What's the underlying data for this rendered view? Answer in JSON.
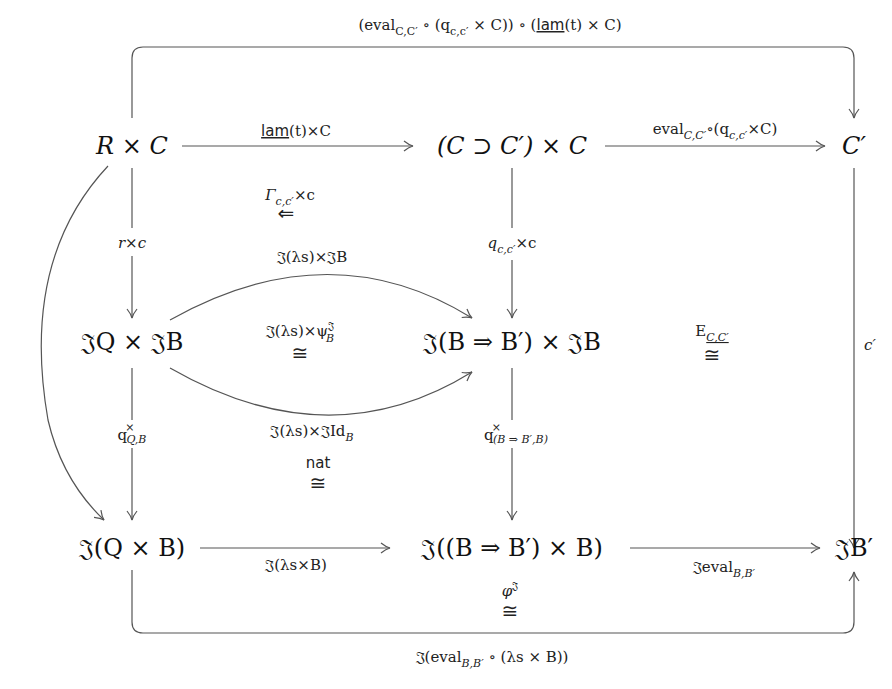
{
  "diagram": {
    "objects": {
      "r_times_c": "R × C",
      "implication_times_c": "(C ⊃ C′) × C",
      "c_prime": "C′",
      "jq_times_jb": "𝔍Q × 𝔍B",
      "j_exp_times_jb": "𝔍(B ⇒ B′) × 𝔍B",
      "j_q_times_b": "𝔍(Q × B)",
      "j_exp_times_b": "𝔍((B ⇒ B′) × B)",
      "j_b_prime": "𝔍B′"
    },
    "arrows": {
      "top_loop": "(eval_{C,C′} ∘ (q_{c,c′} × C)) ∘ (lam(t) × C)",
      "top_loop_parts": {
        "a": "(eval",
        "a_sub": "C,C′",
        "b": " ∘ (q",
        "b_sub": "c,c′",
        "c": " × C)) ∘ (",
        "lam": "lam",
        "d": "(t) × C)"
      },
      "lam_t_times_c": {
        "lam": "lam",
        "rest": "(t)×C"
      },
      "eval_comp": {
        "a": "eval",
        "a_sub": "C,C′",
        "b": "∘(q",
        "b_sub": "c,c′",
        "c": "×C)"
      },
      "r_times_c_down": "r×c",
      "q_times_c_down": {
        "a": "q",
        "a_sub": "c,c′",
        "b": "×c"
      },
      "c_prime_down": "c′",
      "j_lambda_times_jb": "𝔍(λs)×𝔍B",
      "j_lambda_times_jid": {
        "a": "𝔍(λs)×𝔍Id",
        "a_sub": "B"
      },
      "q_cross_qb": {
        "a": "q",
        "sup": "×",
        "sub": "Q,B"
      },
      "q_cross_exp": {
        "a": "q",
        "sup": "×",
        "sub": "(B ⇒ B′,B)"
      },
      "j_lambda_times_b": "𝔍(λs×B)",
      "j_eval": {
        "a": "𝔍eval",
        "a_sub": "B,B′"
      },
      "bottom_loop": {
        "a": "𝔍(eval",
        "a_sub": "B,B′",
        "b": " ∘ (λs × B))"
      }
    },
    "two_cells": {
      "gamma": {
        "a": "Γ",
        "a_sub": "c,c′",
        "b": "×c",
        "arrow": "⇐"
      },
      "psi": {
        "a": "𝔍(λs)×ψ",
        "sup": "𝔍",
        "sub": "B",
        "iso": "≅"
      },
      "e_cc": {
        "a": "E",
        "sub": "C,C′",
        "iso": "≅"
      },
      "nat": {
        "a": "nat",
        "iso": "≅"
      },
      "phi": {
        "a": "φ",
        "sup": "𝔍",
        "iso": "≅"
      }
    }
  }
}
